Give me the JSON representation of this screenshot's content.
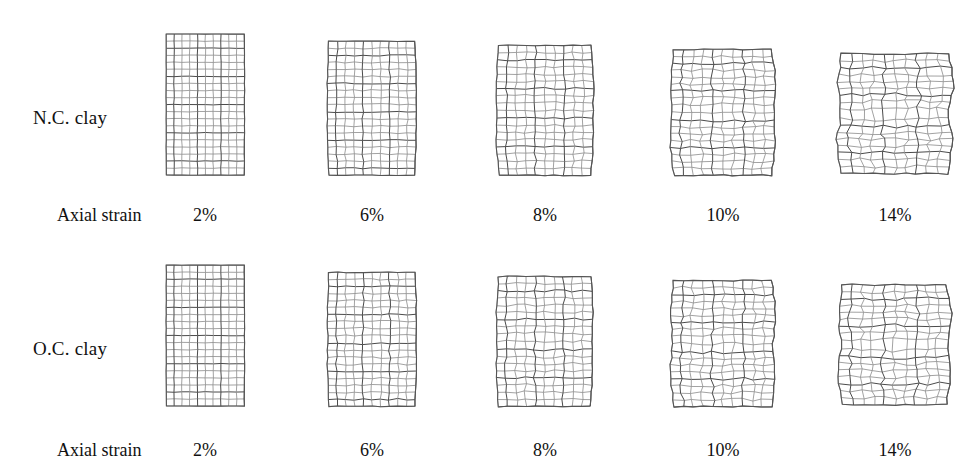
{
  "figure": {
    "type": "deformed-mesh-grid",
    "background_color": "#ffffff",
    "mesh_line_color": "#8a8a8a",
    "mesh_dark_line_color": "#4a4a4a",
    "outline_color": "#555555"
  },
  "rows": [
    {
      "id": "nc-clay",
      "label": "N.C. clay",
      "label_x": 33,
      "label_y": 107,
      "strain_prefix": "Axial strain",
      "strain_prefix_x": 57,
      "strain_prefix_y": 205,
      "strain_label_y": 205,
      "mesh_top": 31,
      "specimens": [
        {
          "strain": "2%",
          "center_x": 205,
          "label_center_x": 205,
          "top": 31,
          "width": 78,
          "height": 141,
          "cols": 10,
          "rows": 20,
          "bulge": 0.005,
          "waist": 0.0,
          "shear": 0.0,
          "jitter": 0.06,
          "seed": 11
        },
        {
          "strain": "6%",
          "center_x": 372,
          "label_center_x": 372,
          "top": 38,
          "width": 86,
          "height": 134,
          "cols": 10,
          "rows": 19,
          "bulge": 0.045,
          "waist": 0.01,
          "shear": 0.06,
          "jitter": 0.13,
          "seed": 23
        },
        {
          "strain": "8%",
          "center_x": 545,
          "label_center_x": 545,
          "top": 42,
          "width": 92,
          "height": 130,
          "cols": 10,
          "rows": 18,
          "bulge": 0.075,
          "waist": 0.03,
          "shear": 0.11,
          "jitter": 0.18,
          "seed": 37
        },
        {
          "strain": "10%",
          "center_x": 723,
          "label_center_x": 723,
          "top": 46,
          "width": 98,
          "height": 126,
          "cols": 10,
          "rows": 18,
          "bulge": 0.1,
          "waist": 0.055,
          "shear": 0.2,
          "jitter": 0.26,
          "seed": 53
        },
        {
          "strain": "14%",
          "center_x": 895,
          "label_center_x": 895,
          "top": 50,
          "width": 106,
          "height": 120,
          "cols": 10,
          "rows": 17,
          "bulge": 0.135,
          "waist": 0.115,
          "shear": 0.4,
          "jitter": 0.34,
          "seed": 71
        }
      ]
    },
    {
      "id": "oc-clay",
      "label": "O.C. clay",
      "label_x": 33,
      "label_y": 338,
      "strain_prefix": "Axial strain",
      "strain_prefix_x": 57,
      "strain_prefix_y": 440,
      "strain_label_y": 440,
      "mesh_top": 262,
      "specimens": [
        {
          "strain": "2%",
          "center_x": 205,
          "label_center_x": 205,
          "top": 262,
          "width": 78,
          "height": 141,
          "cols": 10,
          "rows": 20,
          "bulge": 0.005,
          "waist": 0.0,
          "shear": 0.0,
          "jitter": 0.06,
          "seed": 101
        },
        {
          "strain": "6%",
          "center_x": 372,
          "label_center_x": 372,
          "top": 269,
          "width": 86,
          "height": 134,
          "cols": 10,
          "rows": 19,
          "bulge": 0.045,
          "waist": 0.02,
          "shear": 0.1,
          "jitter": 0.17,
          "seed": 113
        },
        {
          "strain": "8%",
          "center_x": 545,
          "label_center_x": 545,
          "top": 273,
          "width": 92,
          "height": 130,
          "cols": 10,
          "rows": 18,
          "bulge": 0.07,
          "waist": 0.04,
          "shear": 0.17,
          "jitter": 0.22,
          "seed": 127
        },
        {
          "strain": "10%",
          "center_x": 723,
          "label_center_x": 723,
          "top": 277,
          "width": 98,
          "height": 126,
          "cols": 10,
          "rows": 18,
          "bulge": 0.095,
          "waist": 0.07,
          "shear": 0.27,
          "jitter": 0.28,
          "seed": 149
        },
        {
          "strain": "14%",
          "center_x": 895,
          "label_center_x": 895,
          "top": 281,
          "width": 104,
          "height": 120,
          "cols": 10,
          "rows": 17,
          "bulge": 0.125,
          "waist": 0.105,
          "shear": 0.38,
          "jitter": 0.33,
          "seed": 167
        }
      ]
    }
  ],
  "chart_data": {
    "type": "table",
    "categories": [
      "2%",
      "6%",
      "8%",
      "10%",
      "14%"
    ],
    "xlabel": "Axial strain",
    "ylabel": "",
    "series": [
      {
        "name": "N.C. clay",
        "values": [
          2,
          6,
          8,
          10,
          14
        ],
        "deformation_mode": [
          "uniform",
          "slight bulging",
          "barrelling",
          "incipient shear band",
          "X-shaped shear band"
        ]
      },
      {
        "name": "O.C. clay",
        "values": [
          2,
          6,
          8,
          10,
          14
        ],
        "deformation_mode": [
          "uniform",
          "slight bulging with local distortion",
          "barrelling with distortion",
          "developing shear bands",
          "X-shaped shear band"
        ]
      }
    ]
  }
}
